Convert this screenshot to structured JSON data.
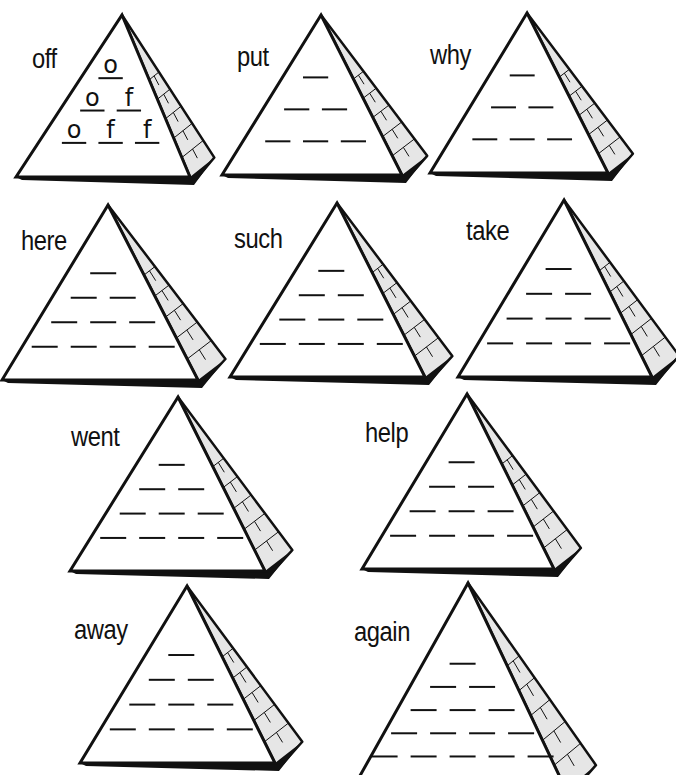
{
  "worksheet": {
    "title": "Word Pyramids",
    "colors": {
      "ink": "#111111",
      "shade": "#e6e6e6",
      "paper": "#ffffff"
    },
    "pyramids": [
      {
        "word": "off",
        "apex": [
          122,
          15
        ],
        "base_left": [
          16,
          177
        ],
        "base_right": [
          190,
          177
        ],
        "word_pos": [
          32,
          46
        ],
        "rows": 3,
        "filled": [
          [
            "o"
          ],
          [
            "o",
            "f"
          ],
          [
            "o",
            "f",
            "f"
          ]
        ]
      },
      {
        "word": "put",
        "apex": [
          321,
          15
        ],
        "base_left": [
          222,
          175
        ],
        "base_right": [
          402,
          175
        ],
        "word_pos": [
          237,
          44
        ],
        "rows": 3,
        "filled": []
      },
      {
        "word": "why",
        "apex": [
          527,
          13
        ],
        "base_left": [
          430,
          173
        ],
        "base_right": [
          608,
          173
        ],
        "word_pos": [
          430,
          42
        ],
        "rows": 3,
        "filled": []
      },
      {
        "word": "here",
        "apex": [
          108,
          205
        ],
        "base_left": [
          2,
          380
        ],
        "base_right": [
          198,
          380
        ],
        "word_pos": [
          21,
          228
        ],
        "rows": 4,
        "filled": []
      },
      {
        "word": "such",
        "apex": [
          337,
          203
        ],
        "base_left": [
          230,
          377
        ],
        "base_right": [
          425,
          377
        ],
        "word_pos": [
          234,
          226
        ],
        "rows": 4,
        "filled": []
      },
      {
        "word": "take",
        "apex": [
          564,
          200
        ],
        "base_left": [
          458,
          377
        ],
        "base_right": [
          652,
          377
        ],
        "word_pos": [
          466,
          218
        ],
        "rows": 4,
        "filled": []
      },
      {
        "word": "went",
        "apex": [
          178,
          397
        ],
        "base_left": [
          70,
          571
        ],
        "base_right": [
          265,
          571
        ],
        "word_pos": [
          71,
          424
        ],
        "rows": 4,
        "filled": []
      },
      {
        "word": "help",
        "apex": [
          467,
          394
        ],
        "base_left": [
          362,
          569
        ],
        "base_right": [
          554,
          569
        ],
        "word_pos": [
          365,
          420
        ],
        "rows": 4,
        "filled": []
      },
      {
        "word": "away",
        "apex": [
          187,
          586
        ],
        "base_left": [
          80,
          763
        ],
        "base_right": [
          275,
          763
        ],
        "word_pos": [
          74,
          617
        ],
        "rows": 4,
        "filled": []
      },
      {
        "word": "again",
        "apex": [
          468,
          583
        ],
        "base_left": [
          352,
          790
        ],
        "base_right": [
          566,
          790
        ],
        "word_pos": [
          354,
          619
        ],
        "rows": 5,
        "filled": []
      }
    ]
  }
}
